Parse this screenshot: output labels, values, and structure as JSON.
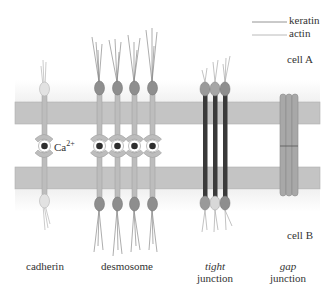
{
  "legend": {
    "items": [
      {
        "label": "keratin",
        "color": "#7a7a7a"
      },
      {
        "label": "actin",
        "color": "#a8a8a8"
      }
    ]
  },
  "cells": {
    "top": "cell A",
    "bottom": "cell B"
  },
  "ion": {
    "symbol": "Ca",
    "charge": "2+"
  },
  "junctions": [
    {
      "name": "cadherin",
      "label_line1": "cadherin",
      "label_line2": ""
    },
    {
      "name": "desmosome",
      "label_line1": "desmosome",
      "label_line2": ""
    },
    {
      "name": "tight-junction",
      "label_line1": "tight",
      "label_line2": "junction"
    },
    {
      "name": "gap-junction",
      "label_line1": "gap",
      "label_line2": "junction"
    }
  ],
  "colors": {
    "membrane": "#c4c4c4",
    "membrane_edge": "#a9a9a9",
    "stalk": "#b8b8b8",
    "plaque_dark": "#8c8c8c",
    "plaque_light": "#dcdcdc",
    "tight_strand": "#3a3a3a",
    "gap_channel": "#a6a6a6",
    "ion_core": "#2e2e2e"
  }
}
